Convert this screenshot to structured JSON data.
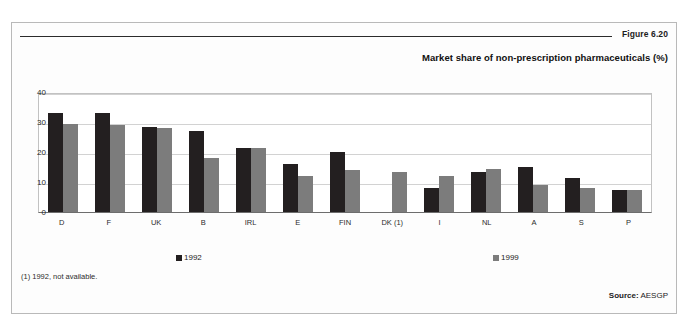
{
  "figure": {
    "number": "Figure 6.20",
    "title": "Market share of non-prescription pharmaceuticals (%)",
    "footnote": "(1) 1992, not available.",
    "source_label": "Source:",
    "source_value": "AESGP"
  },
  "colors": {
    "series_1992": "#231f20",
    "series_1999": "#7c7c7c",
    "frame": "#b9b9b9",
    "gridline": "#d2d2d2",
    "axis": "#6d6d6d"
  },
  "chart_data": {
    "type": "bar",
    "title": "Market share of non-prescription pharmaceuticals (%)",
    "xlabel": "",
    "ylabel": "",
    "ylim": [
      0,
      40
    ],
    "yticks": [
      0,
      10,
      20,
      30,
      40
    ],
    "grid": true,
    "legend_position": "bottom",
    "categories": [
      "D",
      "F",
      "UK",
      "B",
      "IRL",
      "E",
      "FIN",
      "DK (1)",
      "I",
      "NL",
      "A",
      "S",
      "P"
    ],
    "series": [
      {
        "name": "1992",
        "color": "#231f20",
        "values": [
          33,
          33,
          28.5,
          27,
          21.5,
          16,
          20,
          null,
          8,
          13.5,
          15,
          11.5,
          7.5
        ]
      },
      {
        "name": "1999",
        "color": "#7c7c7c",
        "values": [
          29.5,
          29,
          28,
          18,
          21.5,
          12,
          14,
          13.5,
          12,
          14.5,
          9,
          8,
          7.5
        ]
      }
    ]
  }
}
